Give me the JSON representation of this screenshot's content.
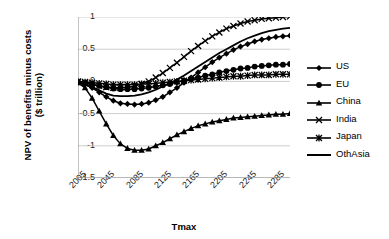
{
  "chart_data": {
    "type": "line",
    "title": "",
    "xlabel": "Tmax",
    "ylabel": "NPV of benefits minus costs ($ trillion)",
    "ylabel_line1": "NPV of benefits minus costs",
    "ylabel_line2": "($ trillion)",
    "ylim": [
      -1.5,
      1
    ],
    "xlim": [
      2005,
      2305
    ],
    "yticks": [
      "1",
      "0.5",
      "0",
      "-0.5",
      "-1",
      "-1.5"
    ],
    "ytick_values": [
      1,
      0.5,
      0,
      -0.5,
      -1,
      -1.5
    ],
    "xticks": [
      "2005",
      "2045",
      "2085",
      "2125",
      "2165",
      "2205",
      "2245",
      "2285"
    ],
    "xtick_values": [
      2005,
      2045,
      2085,
      2125,
      2165,
      2205,
      2245,
      2285
    ],
    "grid": "horizontal",
    "legend_position": "right",
    "x": [
      2005,
      2015,
      2025,
      2035,
      2045,
      2055,
      2065,
      2075,
      2085,
      2095,
      2105,
      2115,
      2125,
      2135,
      2145,
      2155,
      2165,
      2175,
      2185,
      2195,
      2205,
      2215,
      2225,
      2235,
      2245,
      2255,
      2265,
      2275,
      2285,
      2295,
      2305
    ],
    "series": [
      {
        "name": "US",
        "marker": "diamond",
        "color": "#000000",
        "values": [
          -0.02,
          -0.05,
          -0.1,
          -0.17,
          -0.24,
          -0.3,
          -0.34,
          -0.35,
          -0.36,
          -0.35,
          -0.33,
          -0.29,
          -0.24,
          -0.17,
          -0.1,
          -0.02,
          0.06,
          0.14,
          0.22,
          0.3,
          0.37,
          0.43,
          0.49,
          0.54,
          0.58,
          0.62,
          0.65,
          0.67,
          0.69,
          0.7,
          0.71
        ]
      },
      {
        "name": "EU",
        "marker": "circle",
        "color": "#000000",
        "values": [
          -0.01,
          -0.02,
          -0.04,
          -0.07,
          -0.09,
          -0.11,
          -0.12,
          -0.12,
          -0.12,
          -0.11,
          -0.1,
          -0.08,
          -0.06,
          -0.04,
          -0.01,
          0.01,
          0.04,
          0.06,
          0.09,
          0.11,
          0.14,
          0.16,
          0.18,
          0.2,
          0.21,
          0.23,
          0.24,
          0.25,
          0.26,
          0.26,
          0.27
        ]
      },
      {
        "name": "China",
        "marker": "triangle",
        "color": "#000000",
        "values": [
          -0.02,
          -0.1,
          -0.26,
          -0.46,
          -0.66,
          -0.84,
          -0.97,
          -1.04,
          -1.07,
          -1.07,
          -1.05,
          -1.0,
          -0.95,
          -0.89,
          -0.83,
          -0.78,
          -0.73,
          -0.69,
          -0.66,
          -0.63,
          -0.61,
          -0.59,
          -0.57,
          -0.56,
          -0.55,
          -0.54,
          -0.53,
          -0.52,
          -0.51,
          -0.51,
          -0.5
        ]
      },
      {
        "name": "India",
        "marker": "cross",
        "color": "#000000",
        "values": [
          -0.01,
          -0.03,
          -0.05,
          -0.07,
          -0.09,
          -0.1,
          -0.1,
          -0.09,
          -0.07,
          -0.04,
          0.0,
          0.06,
          0.13,
          0.21,
          0.29,
          0.38,
          0.47,
          0.55,
          0.63,
          0.7,
          0.76,
          0.82,
          0.86,
          0.9,
          0.93,
          0.95,
          0.97,
          0.98,
          0.99,
          1.0,
          1.01
        ]
      },
      {
        "name": "Japan",
        "marker": "asterisk",
        "color": "#000000",
        "values": [
          0.0,
          -0.01,
          -0.02,
          -0.03,
          -0.04,
          -0.05,
          -0.05,
          -0.05,
          -0.05,
          -0.04,
          -0.04,
          -0.03,
          -0.02,
          -0.01,
          0.0,
          0.01,
          0.02,
          0.03,
          0.04,
          0.05,
          0.06,
          0.07,
          0.08,
          0.08,
          0.09,
          0.1,
          0.1,
          0.1,
          0.11,
          0.11,
          0.11
        ]
      },
      {
        "name": "OthAsia",
        "marker": "none",
        "color": "#000000",
        "values": [
          -0.01,
          -0.04,
          -0.09,
          -0.14,
          -0.19,
          -0.22,
          -0.23,
          -0.23,
          -0.22,
          -0.2,
          -0.17,
          -0.13,
          -0.08,
          -0.03,
          0.03,
          0.09,
          0.16,
          0.23,
          0.3,
          0.37,
          0.44,
          0.5,
          0.56,
          0.62,
          0.67,
          0.71,
          0.75,
          0.78,
          0.8,
          0.82,
          0.83
        ]
      }
    ]
  }
}
